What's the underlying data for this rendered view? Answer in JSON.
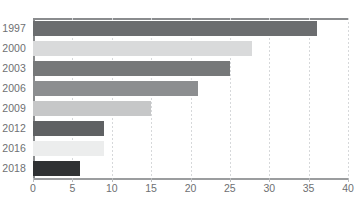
{
  "chart_data": {
    "type": "bar",
    "orientation": "horizontal",
    "title": "",
    "subtitle": "",
    "xlabel": "",
    "ylabel": "",
    "categories": [
      "1997",
      "2000",
      "2003",
      "2006",
      "2009",
      "2012",
      "2016",
      "2018"
    ],
    "values": [
      36,
      27.8,
      25,
      21,
      15,
      9,
      9,
      6
    ],
    "bar_colors": [
      "#6b6d6f",
      "#d9dadb",
      "#767879",
      "#8c8e90",
      "#c6c7c8",
      "#5f6163",
      "#eceded",
      "#2f3133"
    ],
    "xlim": [
      0,
      40
    ],
    "xticks": [
      0,
      5,
      10,
      15,
      20,
      25,
      30,
      35,
      40
    ],
    "xtick_labels": [
      "0",
      "5",
      "10",
      "15",
      "20",
      "25",
      "30",
      "35",
      "40"
    ],
    "grid": true,
    "grid_axis": "x",
    "grid_style": "dotted",
    "legend": false,
    "legend_position": "none",
    "annotations": []
  },
  "style": {
    "background": "#ffffff",
    "tick_label_color": "#6e7072",
    "gridline_color": "#d6d8da",
    "axis_color": "#8a8c8e"
  }
}
